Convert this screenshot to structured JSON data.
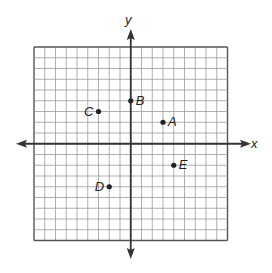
{
  "chart_data": {
    "type": "scatter",
    "title": "",
    "xlabel": "x",
    "ylabel": "y",
    "xlim": [
      -9,
      9
    ],
    "ylim": [
      -9,
      9
    ],
    "grid": true,
    "grid_step": 1,
    "points": [
      {
        "label": "A",
        "x": 3,
        "y": 2
      },
      {
        "label": "B",
        "x": 0,
        "y": 4
      },
      {
        "label": "C",
        "x": -3,
        "y": 3
      },
      {
        "label": "D",
        "x": -2,
        "y": -4
      },
      {
        "label": "E",
        "x": 4,
        "y": -2
      }
    ]
  },
  "colors": {
    "grid": "#9a9a9a",
    "axis": "#333333",
    "point": "#222222"
  }
}
